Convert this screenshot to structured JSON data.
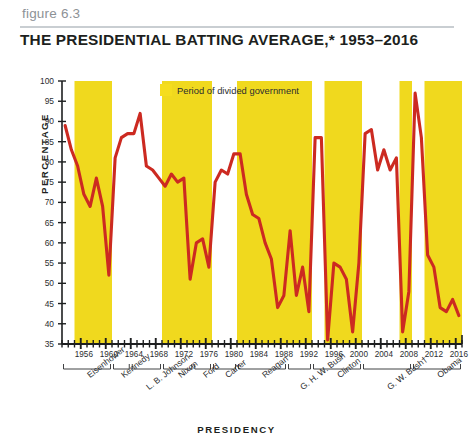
{
  "figure": {
    "number_label": "figure 6.3",
    "title": "THE PRESIDENTIAL BATTING AVERAGE,* 1953–2016"
  },
  "legend": {
    "swatch_color": "#f5dd1e",
    "label": "Period of divided government"
  },
  "axis_titles": {
    "y": "PERCENTAGE",
    "x": "PRESIDENCY"
  },
  "colors": {
    "line": "#cc2a21",
    "band": "#f0d91e",
    "plot_background": "#ffffff",
    "axis": "#1d1f20",
    "title_text": "#1d1f20",
    "figure_label": "#8d9296",
    "rule": "#c9ced2"
  },
  "chart_data": {
    "type": "line",
    "title": "THE PRESIDENTIAL BATTING AVERAGE,* 1953–2016",
    "xlabel": "PRESIDENCY",
    "ylabel": "PERCENTAGE",
    "xlim": [
      1953,
      2016
    ],
    "ylim": [
      35,
      100
    ],
    "y_ticks": [
      35,
      40,
      45,
      50,
      55,
      60,
      65,
      70,
      75,
      80,
      85,
      90,
      95,
      100
    ],
    "x_ticks": [
      1956,
      1960,
      1964,
      1968,
      1972,
      1976,
      1980,
      1984,
      1988,
      1992,
      1996,
      2000,
      2004,
      2008,
      2012,
      2016
    ],
    "grid": false,
    "legend_position": "top-center",
    "series": [
      {
        "name": "Presidential batting average",
        "x": [
          1953,
          1954,
          1955,
          1956,
          1957,
          1958,
          1959,
          1960,
          1961,
          1962,
          1963,
          1964,
          1965,
          1966,
          1967,
          1968,
          1969,
          1970,
          1971,
          1972,
          1973,
          1974,
          1975,
          1976,
          1977,
          1978,
          1979,
          1980,
          1981,
          1982,
          1983,
          1984,
          1985,
          1986,
          1987,
          1988,
          1989,
          1990,
          1991,
          1992,
          1993,
          1994,
          1995,
          1996,
          1997,
          1998,
          1999,
          2000,
          2001,
          2002,
          2003,
          2004,
          2005,
          2006,
          2007,
          2008,
          2009,
          2010,
          2011,
          2012,
          2013,
          2014,
          2015,
          2016
        ],
        "values": [
          89,
          83,
          79,
          72,
          69,
          76,
          69,
          52,
          81,
          86,
          87,
          87,
          92,
          79,
          78,
          76,
          74,
          77,
          75,
          76,
          51,
          60,
          61,
          54,
          75,
          78,
          77,
          82,
          82,
          72,
          67,
          66,
          60,
          56,
          44,
          47,
          63,
          47,
          54,
          43,
          86,
          86,
          36,
          55,
          54,
          51,
          38,
          55,
          87,
          88,
          78,
          83,
          78,
          81,
          38,
          48,
          97,
          86,
          57,
          54,
          44,
          43,
          46,
          42
        ],
        "color": "#cc2a21"
      }
    ],
    "divided_government_periods": [
      {
        "start": 1955,
        "end": 1961
      },
      {
        "start": 1969,
        "end": 1977
      },
      {
        "start": 1981,
        "end": 1993
      },
      {
        "start": 1995,
        "end": 2001
      },
      {
        "start": 2007,
        "end": 2009
      },
      {
        "start": 2011,
        "end": 2017
      }
    ],
    "presidents": [
      {
        "name": "Eisenhower",
        "start": 1953,
        "end": 1961
      },
      {
        "name": "Kennedy",
        "start": 1961,
        "end": 1964
      },
      {
        "name": "L. B. Johnson",
        "start": 1964,
        "end": 1969
      },
      {
        "name": "Nixon",
        "start": 1969,
        "end": 1974
      },
      {
        "name": "Ford",
        "start": 1974,
        "end": 1977
      },
      {
        "name": "Carter",
        "start": 1977,
        "end": 1981
      },
      {
        "name": "Reagan",
        "start": 1981,
        "end": 1989
      },
      {
        "name": "G. H. W. Bush",
        "start": 1989,
        "end": 1993
      },
      {
        "name": "Clinton",
        "start": 1993,
        "end": 2001
      },
      {
        "name": "G. W. Bush†",
        "start": 2001,
        "end": 2009
      },
      {
        "name": "Obama",
        "start": 2009,
        "end": 2017
      }
    ]
  }
}
